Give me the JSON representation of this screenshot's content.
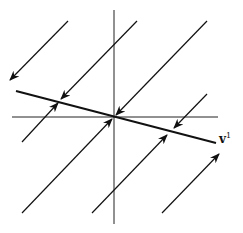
{
  "diagram": {
    "type": "phase-portrait",
    "eigenvector_label": "v",
    "eigenvector_superscript": "1",
    "colors": {
      "lines": "#111111",
      "axes": "#222222"
    },
    "axes": {
      "vertical": {
        "x": 114,
        "y1": 10,
        "y2": 224
      },
      "horizontal": {
        "y": 117,
        "x1": 12,
        "x2": 218
      }
    },
    "eigenline": {
      "x1": 16,
      "y1": 91,
      "x2": 216,
      "y2": 143
    },
    "trajectories": [
      {
        "x1": 68,
        "y1": 21,
        "x2": 10,
        "y2": 80,
        "arrow": "end"
      },
      {
        "x1": 137,
        "y1": 21,
        "x2": 61,
        "y2": 99,
        "arrow": "end"
      },
      {
        "x1": 207,
        "y1": 21,
        "x2": 116,
        "y2": 115,
        "arrow": "end"
      },
      {
        "x1": 207,
        "y1": 94,
        "x2": 174,
        "y2": 128,
        "arrow": "end"
      },
      {
        "x1": 22,
        "y1": 142,
        "x2": 58,
        "y2": 103,
        "arrow": "end"
      },
      {
        "x1": 22,
        "y1": 213,
        "x2": 112,
        "y2": 119,
        "arrow": "end"
      },
      {
        "x1": 92,
        "y1": 213,
        "x2": 167,
        "y2": 135,
        "arrow": "end"
      },
      {
        "x1": 162,
        "y1": 213,
        "x2": 219,
        "y2": 154,
        "arrow": "end"
      }
    ]
  }
}
